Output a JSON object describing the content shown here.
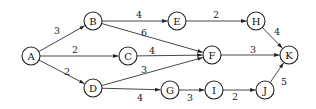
{
  "diagram": {
    "type": "directed-weighted-graph",
    "node_radius": 9,
    "nodes": [
      {
        "id": "A",
        "x": 31,
        "y": 56
      },
      {
        "id": "B",
        "x": 93,
        "y": 21
      },
      {
        "id": "C",
        "x": 128,
        "y": 56
      },
      {
        "id": "D",
        "x": 93,
        "y": 88
      },
      {
        "id": "E",
        "x": 177,
        "y": 21
      },
      {
        "id": "F",
        "x": 212,
        "y": 55
      },
      {
        "id": "G",
        "x": 170,
        "y": 90
      },
      {
        "id": "H",
        "x": 256,
        "y": 21
      },
      {
        "id": "I",
        "x": 214,
        "y": 90
      },
      {
        "id": "J",
        "x": 265,
        "y": 90
      },
      {
        "id": "K",
        "x": 289,
        "y": 55
      }
    ],
    "edges": [
      {
        "from": "A",
        "to": "B",
        "weight": "3",
        "lx": 57,
        "ly": 30
      },
      {
        "from": "A",
        "to": "C",
        "weight": "2",
        "lx": 75,
        "ly": 49
      },
      {
        "from": "A",
        "to": "D",
        "weight": "2",
        "lx": 67,
        "ly": 71
      },
      {
        "from": "B",
        "to": "E",
        "weight": "4",
        "lx": 139,
        "ly": 14
      },
      {
        "from": "B",
        "to": "F",
        "weight": "6",
        "lx": 144,
        "ly": 32
      },
      {
        "from": "C",
        "to": "F",
        "weight": "4",
        "lx": 152,
        "ly": 50
      },
      {
        "from": "D",
        "to": "F",
        "weight": "3",
        "lx": 144,
        "ly": 69
      },
      {
        "from": "D",
        "to": "G",
        "weight": "4",
        "lx": 140,
        "ly": 97
      },
      {
        "from": "E",
        "to": "H",
        "weight": "2",
        "lx": 216,
        "ly": 14
      },
      {
        "from": "F",
        "to": "K",
        "weight": "3",
        "lx": 253,
        "ly": 49
      },
      {
        "from": "G",
        "to": "I",
        "weight": "3",
        "lx": 190,
        "ly": 97
      },
      {
        "from": "I",
        "to": "J",
        "weight": "2",
        "lx": 235,
        "ly": 96
      },
      {
        "from": "H",
        "to": "K",
        "weight": "4",
        "lx": 277,
        "ly": 31
      },
      {
        "from": "J",
        "to": "K",
        "weight": "5",
        "lx": 284,
        "ly": 81
      }
    ]
  }
}
